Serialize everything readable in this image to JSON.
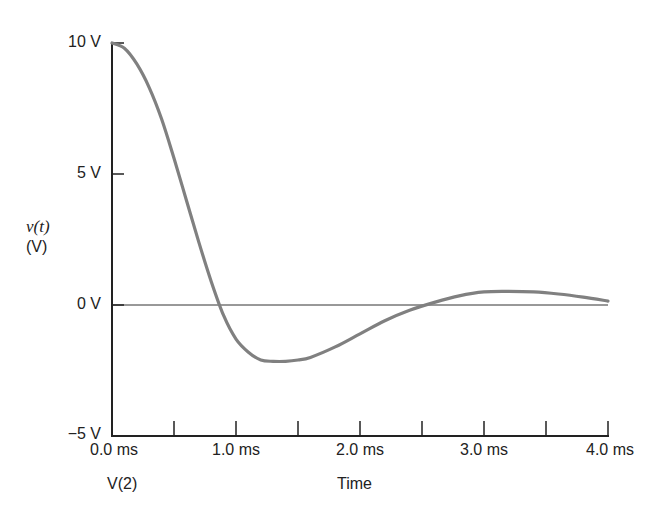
{
  "chart_data": {
    "type": "line",
    "title": "",
    "xlabel": "Time",
    "ylabel": "v(t) (V)",
    "ylabel_line1": "v(t)",
    "ylabel_line2": "(V)",
    "trace_label": "V(2)",
    "xlim": [
      0,
      4
    ],
    "ylim": [
      -5,
      10
    ],
    "x_unit": "ms",
    "grid": false,
    "x_tick_labels": [
      "0.0 ms",
      "1.0 ms",
      "2.0 ms",
      "3.0 ms",
      "4.0 ms"
    ],
    "x_minor_ticks": [
      0.5,
      1.0,
      1.5,
      2.0,
      2.5,
      3.0,
      3.5,
      4.0
    ],
    "y_tick_labels": [
      "10 V",
      "5 V",
      "0 V",
      "−5 V"
    ],
    "y_ticks": [
      10,
      5,
      0,
      -5
    ],
    "series": [
      {
        "name": "V(2)",
        "color": "#808080",
        "x": [
          0.0,
          0.1,
          0.2,
          0.3,
          0.4,
          0.5,
          0.6,
          0.7,
          0.8,
          0.9,
          1.0,
          1.1,
          1.2,
          1.3,
          1.4,
          1.5,
          1.6,
          1.8,
          2.0,
          2.2,
          2.4,
          2.6,
          2.8,
          3.0,
          3.2,
          3.4,
          3.6,
          3.8,
          4.0
        ],
        "y": [
          10.0,
          9.8,
          9.2,
          8.3,
          7.1,
          5.6,
          4.0,
          2.4,
          0.9,
          -0.4,
          -1.3,
          -1.8,
          -2.1,
          -2.15,
          -2.15,
          -2.1,
          -2.0,
          -1.6,
          -1.1,
          -0.6,
          -0.2,
          0.1,
          0.35,
          0.5,
          0.52,
          0.5,
          0.42,
          0.3,
          0.15
        ]
      }
    ]
  }
}
